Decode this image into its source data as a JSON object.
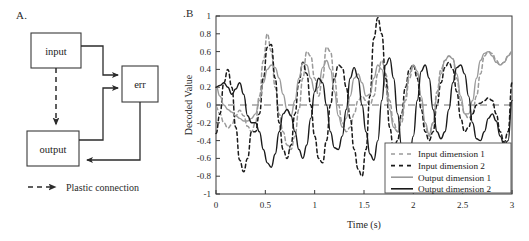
{
  "figure": {
    "panels": [
      {
        "id": "A",
        "label": "A."
      },
      {
        "id": "B",
        "label": ".B"
      }
    ]
  },
  "diagram": {
    "nodes": [
      {
        "id": "input",
        "label": "input"
      },
      {
        "id": "err",
        "label": "err"
      },
      {
        "id": "output",
        "label": "output"
      }
    ],
    "legend": {
      "label": "Plastic connection",
      "style": "dashed-arrow"
    },
    "edges": [
      {
        "from": "input",
        "to": "err",
        "style": "solid"
      },
      {
        "from": "input",
        "to": "output",
        "style": "dashed"
      },
      {
        "from": "output",
        "to": "err",
        "style": "solid"
      },
      {
        "from": "err",
        "to": "output",
        "style": "solid"
      }
    ],
    "colors": {
      "stroke": "#2b2b2b",
      "fill": "#ffffff"
    }
  },
  "chart_data": {
    "type": "line",
    "title": "",
    "xlabel": "Time (s)",
    "ylabel": "Decoded Value",
    "xlim": [
      0,
      3
    ],
    "ylim": [
      -1,
      1
    ],
    "grid": false,
    "zero_line": true,
    "zero_line_style": "dashed",
    "xticks": [
      "0",
      "0.5",
      "1",
      "1.5",
      "2",
      "2.5",
      "3"
    ],
    "xtick_values": [
      0,
      0.5,
      1,
      1.5,
      2,
      2.5,
      3
    ],
    "yticks": [
      "1",
      "0.8",
      "0.6",
      "0.4",
      "0.2",
      "0",
      "-0.2",
      "-0.4",
      "-0.6",
      "-0.8",
      "-1"
    ],
    "ytick_values": [
      1,
      0.8,
      0.6,
      0.4,
      0.2,
      0,
      -0.2,
      -0.4,
      -0.6,
      -0.8,
      -1
    ],
    "legend_position": "lower-right",
    "colors": {
      "input1": "#9a9a9a",
      "input2": "#1a1a1a",
      "output1": "#9a9a9a",
      "output2": "#1a1a1a",
      "axis": "#3a3a3a"
    },
    "series": [
      {
        "name": "Input dimension 1",
        "style": "dashed",
        "color": "#9a9a9a",
        "x": [
          0,
          0.04,
          0.08,
          0.12,
          0.16,
          0.2,
          0.24,
          0.28,
          0.32,
          0.36,
          0.4,
          0.44,
          0.48,
          0.52,
          0.56,
          0.6,
          0.64,
          0.68,
          0.72,
          0.76,
          0.8,
          0.84,
          0.88,
          0.92,
          0.96,
          1,
          1.04,
          1.08,
          1.12,
          1.16,
          1.2,
          1.24,
          1.28,
          1.32,
          1.36,
          1.4,
          1.44,
          1.48,
          1.52,
          1.56,
          1.6,
          1.64,
          1.68,
          1.72,
          1.76,
          1.8,
          1.84,
          1.88,
          1.92,
          1.96,
          2,
          2.04,
          2.08,
          2.12,
          2.16,
          2.2,
          2.24,
          2.28,
          2.32,
          2.36,
          2.4,
          2.44,
          2.48,
          2.52,
          2.56,
          2.6,
          2.64,
          2.68,
          2.72,
          2.76,
          2.8,
          2.84,
          2.88,
          2.92,
          2.96,
          3
        ],
        "values": [
          -0.02,
          -0.1,
          -0.2,
          -0.26,
          -0.22,
          -0.12,
          -0.06,
          -0.12,
          -0.24,
          -0.3,
          -0.2,
          0.1,
          0.5,
          0.8,
          0.6,
          0.2,
          -0.1,
          -0.3,
          -0.45,
          -0.5,
          -0.35,
          -0.05,
          0.3,
          0.6,
          0.55,
          0.3,
          0.1,
          0.3,
          0.65,
          0.6,
          0.3,
          0,
          -0.2,
          -0.3,
          -0.25,
          -0.1,
          0.05,
          0.1,
          0.05,
          0.0,
          0.1,
          0.35,
          0.5,
          0.35,
          0.05,
          -0.2,
          -0.3,
          -0.2,
          0.05,
          0.3,
          0.44,
          0.35,
          0.05,
          -0.25,
          -0.35,
          -0.2,
          0.15,
          0.4,
          0.5,
          0.55,
          0.52,
          0.3,
          0.05,
          -0.1,
          -0.15,
          -0.1,
          0.1,
          0.35,
          0.55,
          0.6,
          0.58,
          0.5,
          0.45,
          0.48,
          0.55,
          0.6
        ]
      },
      {
        "name": "Input dimension 2",
        "style": "dashed",
        "color": "#1a1a1a",
        "x": [
          0,
          0.04,
          0.08,
          0.12,
          0.16,
          0.2,
          0.24,
          0.28,
          0.32,
          0.36,
          0.4,
          0.44,
          0.48,
          0.52,
          0.56,
          0.6,
          0.64,
          0.68,
          0.72,
          0.76,
          0.8,
          0.84,
          0.88,
          0.92,
          0.96,
          1,
          1.04,
          1.08,
          1.12,
          1.16,
          1.2,
          1.24,
          1.28,
          1.32,
          1.36,
          1.4,
          1.44,
          1.48,
          1.52,
          1.56,
          1.6,
          1.64,
          1.68,
          1.72,
          1.76,
          1.8,
          1.84,
          1.88,
          1.92,
          1.96,
          2,
          2.04,
          2.08,
          2.12,
          2.16,
          2.2,
          2.24,
          2.28,
          2.32,
          2.36,
          2.4,
          2.44,
          2.48,
          2.52,
          2.56,
          2.6,
          2.64,
          2.68,
          2.72,
          2.76,
          2.8,
          2.84,
          2.88,
          2.92,
          2.96,
          3
        ],
        "values": [
          -0.32,
          -0.1,
          0.25,
          0.4,
          0.2,
          -0.25,
          -0.62,
          -0.75,
          -0.6,
          -0.3,
          -0.3,
          -0.1,
          0.3,
          0.65,
          0.68,
          0.3,
          -0.2,
          -0.5,
          -0.6,
          -0.45,
          -0.1,
          0.25,
          0.48,
          0.35,
          0.0,
          -0.35,
          -0.6,
          -0.65,
          -0.4,
          0.0,
          0.3,
          0.45,
          0.42,
          0.2,
          -0.15,
          -0.5,
          -0.72,
          -0.8,
          -0.5,
          0.1,
          0.75,
          0.98,
          0.8,
          0.3,
          -0.25,
          -0.5,
          -0.4,
          -0.1,
          0.2,
          0.4,
          0.45,
          0.3,
          -0.05,
          -0.3,
          -0.4,
          -0.3,
          0.0,
          0.25,
          0.42,
          0.48,
          0.4,
          0.15,
          -0.15,
          -0.3,
          -0.25,
          -0.1,
          0.0,
          0.02,
          0.05,
          0.08,
          0.05,
          -0.1,
          -0.3,
          -0.42,
          -0.3,
          0.25
        ]
      },
      {
        "name": "Output dimension 1",
        "style": "solid",
        "color": "#9a9a9a",
        "x": [
          0,
          0.04,
          0.08,
          0.12,
          0.16,
          0.2,
          0.24,
          0.28,
          0.32,
          0.36,
          0.4,
          0.44,
          0.48,
          0.52,
          0.56,
          0.6,
          0.64,
          0.68,
          0.72,
          0.76,
          0.8,
          0.84,
          0.88,
          0.92,
          0.96,
          1,
          1.04,
          1.08,
          1.12,
          1.16,
          1.2,
          1.24,
          1.28,
          1.32,
          1.36,
          1.4,
          1.44,
          1.48,
          1.52,
          1.56,
          1.6,
          1.64,
          1.68,
          1.72,
          1.76,
          1.8,
          1.84,
          1.88,
          1.92,
          1.96,
          2,
          2.04,
          2.08,
          2.12,
          2.16,
          2.2,
          2.24,
          2.28,
          2.32,
          2.36,
          2.4,
          2.44,
          2.48,
          2.52,
          2.56,
          2.6,
          2.64,
          2.68,
          2.72,
          2.76,
          2.8,
          2.84,
          2.88,
          2.92,
          2.96,
          3
        ],
        "values": [
          0.22,
          0.1,
          0.0,
          -0.05,
          -0.08,
          -0.12,
          -0.15,
          -0.18,
          -0.18,
          -0.15,
          -0.1,
          0.05,
          0.25,
          0.4,
          0.45,
          0.42,
          0.3,
          0.12,
          -0.05,
          -0.12,
          0.05,
          0.3,
          0.47,
          0.45,
          0.3,
          0.15,
          0.2,
          0.42,
          0.5,
          0.4,
          0.15,
          -0.12,
          -0.25,
          -0.15,
          0.1,
          0.3,
          0.35,
          0.25,
          0.1,
          0.12,
          0.3,
          0.45,
          0.4,
          0.2,
          -0.05,
          -0.25,
          -0.3,
          -0.15,
          0.1,
          0.35,
          0.45,
          0.38,
          0.1,
          -0.2,
          -0.33,
          -0.2,
          0.1,
          0.35,
          0.5,
          0.55,
          0.52,
          0.35,
          0.1,
          -0.1,
          -0.1,
          0.05,
          0.3,
          0.5,
          0.58,
          0.6,
          0.55,
          0.48,
          0.45,
          0.48,
          0.55,
          0.6
        ]
      },
      {
        "name": "Output dimension 2",
        "style": "solid",
        "color": "#1a1a1a",
        "x": [
          0,
          0.04,
          0.08,
          0.12,
          0.16,
          0.2,
          0.24,
          0.28,
          0.32,
          0.36,
          0.4,
          0.44,
          0.48,
          0.52,
          0.56,
          0.6,
          0.64,
          0.68,
          0.72,
          0.76,
          0.8,
          0.84,
          0.88,
          0.92,
          0.96,
          1,
          1.04,
          1.08,
          1.12,
          1.16,
          1.2,
          1.24,
          1.28,
          1.32,
          1.36,
          1.4,
          1.44,
          1.48,
          1.52,
          1.56,
          1.6,
          1.64,
          1.68,
          1.72,
          1.76,
          1.8,
          1.84,
          1.88,
          1.92,
          1.96,
          2,
          2.04,
          2.08,
          2.12,
          2.16,
          2.2,
          2.24,
          2.28,
          2.32,
          2.36,
          2.4,
          2.44,
          2.48,
          2.52,
          2.56,
          2.6,
          2.64,
          2.68,
          2.72,
          2.76,
          2.8,
          2.84,
          2.88,
          2.92,
          2.96,
          3
        ],
        "values": [
          0.2,
          0.22,
          0.25,
          0.2,
          0.12,
          0.18,
          0.25,
          0.12,
          -0.12,
          -0.2,
          -0.2,
          -0.3,
          -0.5,
          -0.65,
          -0.7,
          -0.55,
          -0.3,
          -0.1,
          -0.05,
          -0.12,
          -0.3,
          -0.5,
          -0.6,
          -0.45,
          -0.15,
          0.15,
          0.3,
          0.25,
          0.0,
          -0.3,
          -0.48,
          -0.5,
          -0.35,
          -0.05,
          0.3,
          0.42,
          0.3,
          0.0,
          -0.3,
          -0.55,
          -0.62,
          -0.4,
          0.05,
          0.45,
          0.53,
          0.3,
          -0.1,
          -0.45,
          -0.6,
          -0.62,
          -0.35,
          0.05,
          0.38,
          0.45,
          0.3,
          -0.05,
          -0.3,
          -0.38,
          -0.3,
          -0.05,
          0.25,
          0.42,
          0.45,
          0.35,
          0.1,
          -0.2,
          -0.38,
          -0.4,
          -0.3,
          -0.15,
          -0.1,
          -0.18,
          -0.35,
          -0.45,
          -0.4,
          0.05
        ]
      }
    ]
  }
}
